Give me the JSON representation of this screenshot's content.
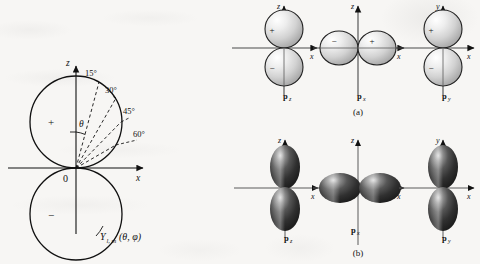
{
  "figure": {
    "left_panel": {
      "name": "spherical-harmonic-polar-plot",
      "axis_vertical": "z",
      "axis_horizontal": "x",
      "origin_label": "0",
      "theta_label": "θ",
      "lobe_upper_sign": "+",
      "lobe_lower_sign": "−",
      "angle_labels": [
        "15°",
        "30°",
        "45°",
        "60°"
      ],
      "function_label": "Y",
      "function_subscript": "l, m",
      "function_args": "(θ, φ)"
    },
    "panel_a": {
      "caption": "(a)",
      "orbitals": [
        {
          "label": "p",
          "sub": "z",
          "axis_vertical": "z",
          "axis_horizontal": "x",
          "orientation": "vertical",
          "sign_first": "+",
          "sign_second": "−"
        },
        {
          "label": "p",
          "sub": "x",
          "axis_vertical": "z",
          "axis_horizontal": "x",
          "orientation": "horizontal",
          "sign_first": "−",
          "sign_second": "+"
        },
        {
          "label": "p",
          "sub": "y",
          "axis_vertical": "y",
          "axis_horizontal": "x",
          "orientation": "vertical",
          "sign_first": "+",
          "sign_second": "−"
        }
      ]
    },
    "panel_b": {
      "caption": "(b)",
      "orbitals": [
        {
          "label": "p",
          "sub": "z",
          "axis_vertical": "z",
          "axis_horizontal": "x",
          "orientation": "vertical"
        },
        {
          "label": "p",
          "sub": "x",
          "axis_vertical": "z",
          "axis_horizontal": "x",
          "orientation": "horizontal"
        },
        {
          "label": "p",
          "sub": "y",
          "axis_vertical": "y",
          "axis_horizontal": "x",
          "orientation": "vertical"
        }
      ]
    }
  },
  "colors": {
    "ink": "#111111",
    "paper": "#f7f6f4",
    "sphere_light": "#fdfdfd",
    "sphere_mid": "#c9c9c9",
    "sphere_dark": "#8d8d8d",
    "lobe_light": "#b9b9b9",
    "lobe_dark": "#2a2a2a"
  }
}
